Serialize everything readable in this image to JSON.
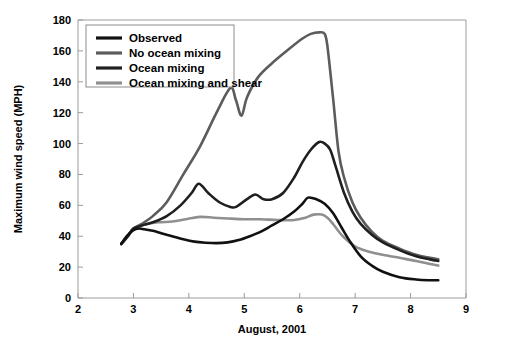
{
  "chart_data": {
    "type": "line",
    "title": "",
    "xlabel": "August, 2001",
    "ylabel": "Maximum wind speed (MPH)",
    "xlim": [
      2,
      9
    ],
    "ylim": [
      0,
      180
    ],
    "xticks": [
      "2",
      "3",
      "4",
      "5",
      "6",
      "7",
      "8",
      "9"
    ],
    "yticks": [
      "0",
      "20",
      "40",
      "60",
      "80",
      "100",
      "120",
      "140",
      "160",
      "180"
    ],
    "grid": false,
    "legend_position": "top-left",
    "series": [
      {
        "name": "Observed",
        "color": "#111111",
        "width": 2.6,
        "x": [
          2.78,
          2.88,
          3.0,
          3.1,
          3.2,
          3.35,
          3.5,
          3.7,
          3.9,
          4.1,
          4.3,
          4.5,
          4.7,
          4.9,
          5.1,
          5.3,
          5.5,
          5.7,
          5.9,
          6.05,
          6.15,
          6.3,
          6.45,
          6.6,
          6.75,
          6.9,
          7.1,
          7.3,
          7.5,
          7.8,
          8.1,
          8.35,
          8.5
        ],
        "y": [
          35,
          40,
          44,
          45,
          44.5,
          43.5,
          42,
          40,
          38,
          36.5,
          35.8,
          35.5,
          36,
          37.5,
          40,
          43,
          47,
          51,
          56,
          61,
          65,
          64,
          61,
          55,
          46,
          37,
          27,
          21,
          17,
          13.5,
          12,
          11.5,
          11.5
        ]
      },
      {
        "name": "No ocean mixing",
        "color": "#5c5c5c",
        "width": 2.6,
        "x": [
          2.78,
          2.9,
          3.0,
          3.15,
          3.35,
          3.6,
          3.9,
          4.2,
          4.5,
          4.75,
          4.85,
          4.95,
          5.05,
          5.25,
          5.5,
          5.8,
          6.05,
          6.2,
          6.35,
          6.45,
          6.5,
          6.6,
          6.7,
          6.8,
          6.95,
          7.1,
          7.3,
          7.5,
          7.8,
          8.1,
          8.35,
          8.5
        ],
        "y": [
          35,
          40,
          45,
          48,
          53,
          62,
          80,
          98,
          120,
          136,
          128,
          118,
          130,
          143,
          152,
          161,
          168,
          171,
          172,
          171,
          163,
          130,
          95,
          78,
          62,
          52,
          43,
          37,
          32,
          28,
          26,
          25
        ]
      },
      {
        "name": "Ocean mixing",
        "color": "#1f1f1f",
        "width": 2.6,
        "x": [
          2.78,
          2.9,
          3.0,
          3.15,
          3.35,
          3.6,
          3.85,
          4.05,
          4.18,
          4.35,
          4.55,
          4.75,
          4.85,
          5.05,
          5.2,
          5.35,
          5.5,
          5.7,
          5.9,
          6.05,
          6.2,
          6.35,
          6.45,
          6.55,
          6.65,
          6.8,
          6.95,
          7.1,
          7.3,
          7.5,
          7.8,
          8.1,
          8.35,
          8.5
        ],
        "y": [
          35,
          40,
          45,
          47,
          49,
          53,
          60,
          68,
          74,
          68,
          62,
          59,
          59,
          64,
          67,
          64,
          64,
          68,
          78,
          88,
          96,
          101,
          100,
          96,
          85,
          68,
          56,
          48,
          41,
          36,
          31,
          27,
          25,
          24
        ]
      },
      {
        "name": "Ocean mixing and shear",
        "color": "#8f8f8f",
        "width": 2.6,
        "x": [
          2.78,
          2.9,
          3.0,
          3.2,
          3.45,
          3.7,
          3.95,
          4.2,
          4.45,
          4.7,
          5.0,
          5.3,
          5.6,
          5.9,
          6.1,
          6.25,
          6.4,
          6.5,
          6.6,
          6.75,
          6.9,
          7.05,
          7.25,
          7.5,
          7.8,
          8.1,
          8.35,
          8.5
        ],
        "y": [
          35,
          40,
          45,
          47.5,
          49,
          49.5,
          51,
          52.5,
          52,
          51.5,
          51,
          51,
          50.5,
          50.5,
          52,
          54,
          54,
          52,
          48,
          41,
          36,
          32.5,
          30,
          28,
          26,
          24,
          22,
          21
        ]
      }
    ]
  },
  "legend": {
    "entries": [
      {
        "label": "Observed"
      },
      {
        "label": "No ocean mixing"
      },
      {
        "label": "Ocean mixing"
      },
      {
        "label": "Ocean mixing and shear"
      }
    ]
  }
}
